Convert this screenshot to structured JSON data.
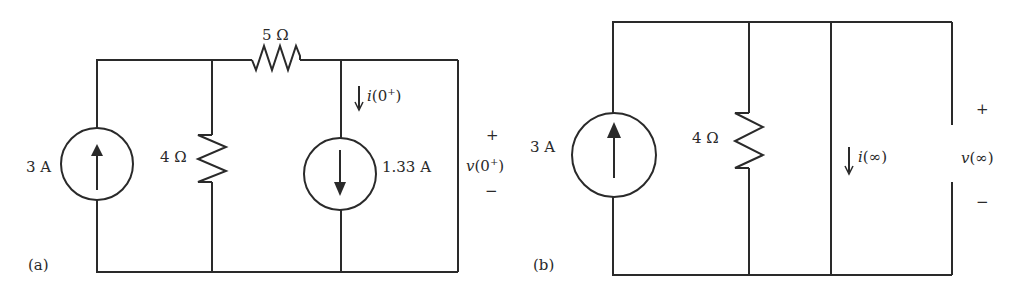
{
  "circuit_a": {
    "panel_label": "(a)",
    "source_left": {
      "value": "3 A",
      "direction": "up"
    },
    "resistor_shunt": {
      "value": "4 Ω"
    },
    "resistor_series": {
      "value": "5 Ω"
    },
    "source_right": {
      "value": "1.33 A",
      "direction": "down"
    },
    "current_label": {
      "prefix": "↓",
      "name": "i",
      "arg_open": "(0",
      "arg_sup": "+",
      "arg_close": ")"
    },
    "voltage_label": {
      "plus": "+",
      "minus": "−",
      "name": "v",
      "arg_open": "(0",
      "arg_sup": "+",
      "arg_close": ")"
    }
  },
  "circuit_b": {
    "panel_label": "(b)",
    "source_left": {
      "value": "3 A",
      "direction": "up"
    },
    "resistor_shunt": {
      "value": "4 Ω"
    },
    "current_label": {
      "prefix": "↓",
      "name": "i",
      "arg": "(∞)"
    },
    "voltage_label": {
      "plus": "+",
      "minus": "−",
      "name": "v",
      "arg": "(∞)"
    }
  },
  "colors": {
    "line": "#2a2a2a",
    "background": "#ffffff"
  }
}
